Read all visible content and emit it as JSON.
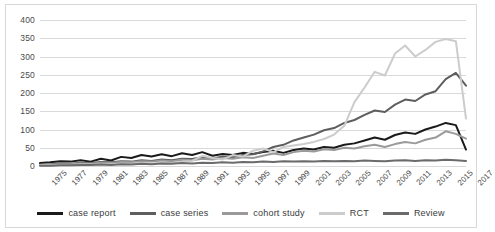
{
  "chart_data": {
    "type": "line",
    "title": "",
    "xlabel": "",
    "ylabel": "",
    "ylim": [
      0,
      400
    ],
    "ytick_step": 50,
    "yticks": [
      400,
      350,
      300,
      250,
      200,
      150,
      100,
      50,
      0
    ],
    "grid": "horizontal",
    "legend_position": "bottom",
    "x": [
      1975,
      1976,
      1977,
      1978,
      1979,
      1980,
      1981,
      1982,
      1983,
      1984,
      1985,
      1986,
      1987,
      1988,
      1989,
      1990,
      1991,
      1992,
      1993,
      1994,
      1995,
      1996,
      1997,
      1998,
      1999,
      2000,
      2001,
      2002,
      2003,
      2004,
      2005,
      2006,
      2007,
      2008,
      2009,
      2010,
      2011,
      2012,
      2013,
      2014,
      2015,
      2016,
      2017
    ],
    "xtick_labels": [
      "1975",
      "1977",
      "1979",
      "1981",
      "1983",
      "1985",
      "1987",
      "1989",
      "1991",
      "1993",
      "1995",
      "1997",
      "1999",
      "2001",
      "2003",
      "2005",
      "2007",
      "2009",
      "2011",
      "2013",
      "2015",
      "2017"
    ],
    "series": [
      {
        "name": "case report",
        "color": "#1a1a1a",
        "values": [
          8,
          10,
          13,
          12,
          16,
          12,
          20,
          15,
          25,
          22,
          30,
          26,
          32,
          27,
          35,
          30,
          38,
          28,
          33,
          30,
          36,
          33,
          38,
          42,
          36,
          44,
          48,
          45,
          52,
          50,
          58,
          62,
          70,
          78,
          72,
          85,
          92,
          88,
          100,
          108,
          118,
          112,
          45
        ]
      },
      {
        "name": "case series",
        "color": "#5e5e5e",
        "values": [
          4,
          5,
          7,
          6,
          9,
          8,
          11,
          10,
          13,
          12,
          16,
          14,
          18,
          16,
          20,
          19,
          24,
          20,
          26,
          24,
          30,
          32,
          40,
          52,
          58,
          70,
          78,
          86,
          98,
          104,
          118,
          126,
          140,
          152,
          148,
          168,
          182,
          178,
          196,
          205,
          238,
          255,
          220
        ]
      },
      {
        "name": "cohort study",
        "color": "#9a9a9a",
        "values": [
          3,
          4,
          5,
          5,
          7,
          6,
          9,
          8,
          11,
          10,
          13,
          12,
          15,
          13,
          17,
          16,
          20,
          18,
          22,
          20,
          24,
          22,
          28,
          34,
          30,
          38,
          42,
          40,
          46,
          44,
          50,
          48,
          54,
          58,
          52,
          60,
          66,
          62,
          72,
          78,
          95,
          88,
          75
        ]
      },
      {
        "name": "RCT",
        "color": "#cccccc",
        "values": [
          2,
          2,
          3,
          3,
          4,
          4,
          5,
          5,
          6,
          6,
          8,
          7,
          9,
          8,
          12,
          14,
          28,
          22,
          18,
          30,
          26,
          42,
          48,
          38,
          52,
          56,
          60,
          66,
          74,
          86,
          110,
          175,
          215,
          258,
          248,
          308,
          330,
          300,
          318,
          340,
          348,
          342,
          130
        ]
      },
      {
        "name": "Review",
        "color": "#6b6b6b",
        "values": [
          1,
          1,
          2,
          2,
          3,
          3,
          4,
          3,
          5,
          4,
          6,
          5,
          7,
          6,
          8,
          7,
          9,
          8,
          10,
          9,
          11,
          10,
          12,
          11,
          13,
          12,
          13,
          12,
          14,
          13,
          14,
          13,
          15,
          14,
          13,
          15,
          16,
          14,
          16,
          15,
          17,
          16,
          14
        ]
      }
    ]
  },
  "legend": {
    "items": [
      {
        "label": "case report"
      },
      {
        "label": "case series"
      },
      {
        "label": "cohort study"
      },
      {
        "label": "RCT"
      },
      {
        "label": "Review"
      }
    ]
  }
}
